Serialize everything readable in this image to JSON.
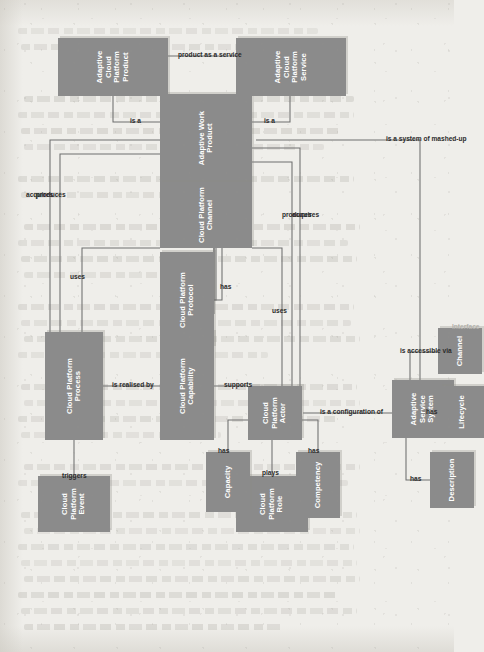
{
  "diagram": {
    "type": "uml-class-diagram",
    "orientation": "rotated-90-ccw",
    "colors": {
      "node_fill": "#8b8b8b",
      "node_text": "#ffffff",
      "edge_line": "#6f6f6f",
      "edge_label": "#2b2b2b",
      "ghost_label": "#b3b1ab",
      "page_background": "#efeeea"
    },
    "nodes": [
      {
        "id": "cp_event",
        "label": "Cloud Platform Event",
        "lines": [
          "Cloud",
          "Platform",
          "Event"
        ]
      },
      {
        "id": "cp_process",
        "label": "Cloud Platform Process",
        "lines": [
          "Cloud Platform",
          "Process"
        ]
      },
      {
        "id": "cp_capability",
        "label": "Cloud Platform Capability",
        "lines": [
          "Cloud Platform",
          "Capability"
        ]
      },
      {
        "id": "cp_protocol",
        "label": "Cloud Platform Protocol",
        "lines": [
          "Cloud Platform",
          "Protocol"
        ]
      },
      {
        "id": "cp_channel",
        "label": "Cloud Platform Channel",
        "lines": [
          "Cloud Platform",
          "Channel"
        ]
      },
      {
        "id": "cp_role",
        "label": "Cloud Platform Role",
        "lines": [
          "Cloud",
          "Platform",
          "Role"
        ]
      },
      {
        "id": "cp_actor",
        "label": "Cloud Platform Actor",
        "lines": [
          "Cloud",
          "Platform",
          "Actor"
        ]
      },
      {
        "id": "capacity",
        "label": "Capacity",
        "lines": [
          "Capacity"
        ]
      },
      {
        "id": "competency",
        "label": "Competency",
        "lines": [
          "Competency"
        ]
      },
      {
        "id": "adaptive_work_product",
        "label": "Adaptive Work Product",
        "lines": [
          "Adaptive Work",
          "Product"
        ]
      },
      {
        "id": "acp_product",
        "label": "Adaptive Cloud Platform Product",
        "lines": [
          "Adaptive Cloud",
          "Platform Product"
        ]
      },
      {
        "id": "acp_service",
        "label": "Adaptive Cloud Platform Service",
        "lines": [
          "Adaptive Cloud",
          "Platform Service"
        ]
      },
      {
        "id": "adaptive_service_system",
        "label": "Adaptive Service System",
        "lines": [
          "Adaptive",
          "Service System"
        ]
      },
      {
        "id": "description",
        "label": "Description",
        "lines": [
          "Description"
        ]
      },
      {
        "id": "lifecycle",
        "label": "Lifecycle",
        "lines": [
          "Lifecycle"
        ]
      },
      {
        "id": "channel",
        "label": "Channel",
        "lines": [
          "Channel"
        ]
      }
    ],
    "edges": [
      {
        "id": "e1",
        "label": "triggers",
        "from": "cp_event",
        "to": "cp_process"
      },
      {
        "id": "e2",
        "label": "is realised by",
        "from": "cp_process",
        "to": "cp_capability"
      },
      {
        "id": "e3",
        "label": "uses",
        "from": "cp_process",
        "to": "cp_channel"
      },
      {
        "id": "e4",
        "label": "produces",
        "from": "cp_process",
        "to": "adaptive_work_product"
      },
      {
        "id": "e5",
        "label": "acquires",
        "from": "cp_process",
        "to": "adaptive_work_product"
      },
      {
        "id": "e6",
        "label": "supports",
        "from": "cp_actor",
        "to": "cp_capability"
      },
      {
        "id": "e7",
        "label": "has",
        "from": "cp_channel",
        "to": "cp_protocol"
      },
      {
        "id": "e8",
        "label": "plays",
        "from": "cp_actor",
        "to": "cp_role"
      },
      {
        "id": "e9",
        "label": "has",
        "from": "cp_actor",
        "to": "capacity"
      },
      {
        "id": "e10",
        "label": "has",
        "from": "cp_actor",
        "to": "competency"
      },
      {
        "id": "e11",
        "label": "uses",
        "from": "cp_actor",
        "to": "cp_channel"
      },
      {
        "id": "e12",
        "label": "produces",
        "from": "cp_actor",
        "to": "adaptive_work_product"
      },
      {
        "id": "e13",
        "label": "acquires",
        "from": "cp_actor",
        "to": "adaptive_work_product"
      },
      {
        "id": "e14",
        "label": "is accessible via",
        "from": "adaptive_work_product",
        "to": "cp_channel"
      },
      {
        "id": "e15",
        "label": "Interface",
        "from": "cp_channel",
        "to": "adaptive_work_product",
        "style": "ghost"
      },
      {
        "id": "e16",
        "label": "is a",
        "from": "acp_product",
        "to": "adaptive_work_product",
        "kind": "generalization"
      },
      {
        "id": "e17",
        "label": "is a",
        "from": "acp_service",
        "to": "adaptive_work_product",
        "kind": "generalization"
      },
      {
        "id": "e18",
        "label": "product as a service",
        "from": "acp_service",
        "to": "acp_product",
        "kind": "aggregation"
      },
      {
        "id": "e19",
        "label": "is a configuration of",
        "from": "adaptive_service_system",
        "to": "cp_actor"
      },
      {
        "id": "e20",
        "label": "is a system of mashed-up",
        "from": "adaptive_service_system",
        "to": "adaptive_work_product"
      },
      {
        "id": "e21",
        "label": "has",
        "from": "adaptive_service_system",
        "to": "description"
      },
      {
        "id": "e22",
        "label": "has",
        "from": "adaptive_service_system",
        "to": "lifecycle"
      },
      {
        "id": "e23",
        "label": "is accessible via",
        "from": "adaptive_service_system",
        "to": "channel"
      },
      {
        "id": "e24",
        "label": "Interface",
        "from": "channel",
        "to": "adaptive_service_system",
        "style": "ghost"
      }
    ]
  }
}
